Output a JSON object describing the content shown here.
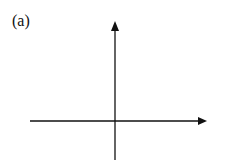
{
  "figure": {
    "label": "(a)",
    "axes": {
      "x_axis": {
        "from": [
          30,
          121
        ],
        "to": [
          207,
          121
        ],
        "arrow": "right"
      },
      "y_axis": {
        "from": [
          115,
          160
        ],
        "to": [
          115,
          22
        ],
        "arrow": "up"
      }
    },
    "colors": {
      "stroke": "#111111",
      "background": "#ffffff"
    }
  }
}
